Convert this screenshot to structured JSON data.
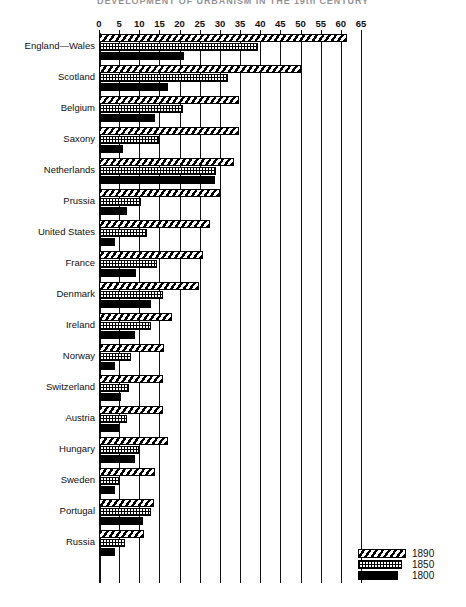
{
  "title": "DEVELOPMENT OF URBANISM IN THE 19th CENTURY",
  "legend": {
    "position": "bottom-right",
    "entries": [
      {
        "label": "1890",
        "pattern": "diagonal-hatch"
      },
      {
        "label": "1850",
        "pattern": "dotted-stipple"
      },
      {
        "label": "1800",
        "pattern": "solid-black"
      }
    ]
  },
  "axis": {
    "ticks": [
      "0",
      "5",
      "10",
      "15",
      "20",
      "25",
      "30",
      "35",
      "40",
      "45",
      "50",
      "55",
      "60",
      "65"
    ]
  },
  "chart_data": {
    "type": "bar",
    "orientation": "horizontal",
    "title": "DEVELOPMENT OF URBANISM IN THE 19th CENTURY",
    "xlabel": "",
    "ylabel": "",
    "xlim": [
      0,
      65
    ],
    "xticks": [
      0,
      5,
      10,
      15,
      20,
      25,
      30,
      35,
      40,
      45,
      50,
      55,
      60,
      65
    ],
    "grid": true,
    "legend_position": "bottom-right",
    "categories": [
      "England—Wales",
      "Scotland",
      "Belgium",
      "Saxony",
      "Netherlands",
      "Prussia",
      "United States",
      "France",
      "Denmark",
      "Ireland",
      "Norway",
      "Switzerland",
      "Austria",
      "Hungary",
      "Sweden",
      "Portugal",
      "Russia"
    ],
    "series": [
      {
        "name": "1890",
        "pattern": "diagonal-hatch",
        "values": [
          61.5,
          50.0,
          34.8,
          34.8,
          33.5,
          30.0,
          27.6,
          25.9,
          24.8,
          18.0,
          16.2,
          16.0,
          15.8,
          17.2,
          14.0,
          13.6,
          11.2
        ]
      },
      {
        "name": "1850",
        "pattern": "dotted-stipple",
        "values": [
          39.5,
          32.0,
          20.8,
          15.0,
          29.0,
          10.5,
          12.0,
          14.5,
          16.0,
          13.0,
          8.0,
          7.5,
          7.0,
          10.0,
          5.0,
          13.0,
          6.5
        ]
      },
      {
        "name": "1800",
        "pattern": "solid-black",
        "values": [
          21.0,
          17.0,
          13.8,
          6.0,
          28.8,
          7.0,
          4.0,
          9.2,
          13.0,
          9.0,
          4.0,
          5.5,
          5.0,
          9.0,
          4.0,
          11.0,
          4.0
        ]
      }
    ]
  }
}
